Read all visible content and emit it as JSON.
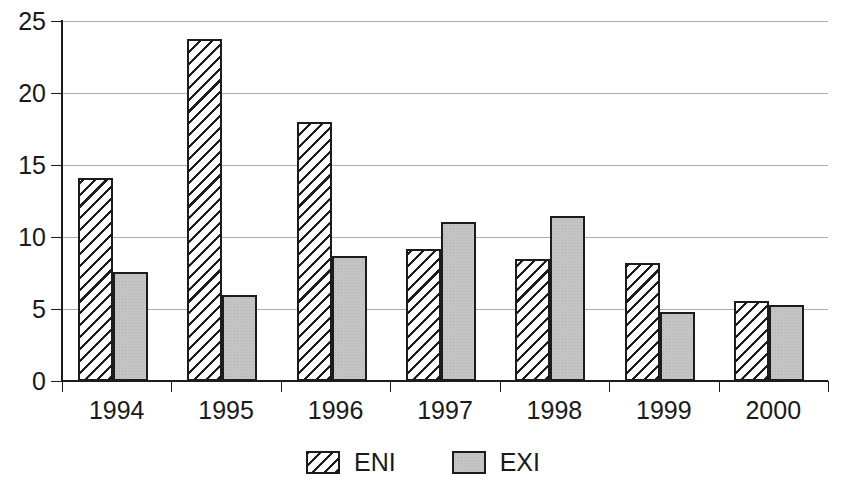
{
  "chart_data": {
    "type": "bar",
    "title": "",
    "subtitle": "",
    "xlabel": "",
    "ylabel": "",
    "categories": [
      "1994",
      "1995",
      "1996",
      "1997",
      "1998",
      "1999",
      "2000"
    ],
    "series": [
      {
        "name": "ENI",
        "values": [
          14.0,
          23.7,
          17.9,
          9.1,
          8.4,
          8.1,
          5.5
        ]
      },
      {
        "name": "EXI",
        "values": [
          7.5,
          5.9,
          8.6,
          11.0,
          11.4,
          4.7,
          5.2
        ]
      }
    ],
    "ylim": [
      0,
      25
    ],
    "ytick_labels": [
      "0",
      "5",
      "10",
      "15",
      "20",
      "25"
    ],
    "ytick_values": [
      0,
      5,
      10,
      15,
      20,
      25
    ],
    "grid": true,
    "legend_position": "bottom-center",
    "legend_entries": [
      "ENI",
      "EXI"
    ],
    "annotations": [],
    "colors": {
      "background": "#ffffff",
      "axis": "#1c1c1c",
      "grid": "#aeaeae",
      "series_eni_fill": "#ffffff",
      "series_eni_hatch": "#1c1c1c",
      "series_exi_fill": "#c4c4c4",
      "text": "#1a1a1a"
    }
  }
}
